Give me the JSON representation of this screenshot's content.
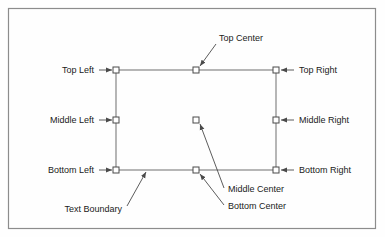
{
  "figure": {
    "background_color": "#fefefe",
    "frame_color": "#8c8c8c",
    "line_color": "#6e6e6e",
    "text_color": "#1a1a1a",
    "handle_fill": "#ffffff",
    "handle_stroke": "#4a4a4a"
  },
  "frame": {
    "x": 8,
    "y": 8,
    "width": 368,
    "height": 221
  },
  "text_boundary": {
    "label": "Text Boundary",
    "x": 116,
    "y": 70,
    "width": 160,
    "height": 100
  },
  "anchors": [
    {
      "name": "top-left",
      "label": "Top Left",
      "x": 116,
      "y": 70,
      "label_x": 94,
      "label_y": 73,
      "label_anchor": "end",
      "leader": "horizontal-right"
    },
    {
      "name": "top-center",
      "label": "Top Center",
      "x": 196,
      "y": 70,
      "label_x": 219,
      "label_y": 41,
      "label_anchor": "start",
      "leader": "diagonal-down-left"
    },
    {
      "name": "top-right",
      "label": "Top Right",
      "x": 276,
      "y": 70,
      "label_x": 299,
      "label_y": 73,
      "label_anchor": "start",
      "leader": "horizontal-left"
    },
    {
      "name": "middle-left",
      "label": "Middle Left",
      "x": 116,
      "y": 120,
      "label_x": 94,
      "label_y": 123,
      "label_anchor": "end",
      "leader": "horizontal-right"
    },
    {
      "name": "middle-center",
      "label": "Middle Center",
      "x": 196,
      "y": 120,
      "label_x": 228,
      "label_y": 192,
      "label_anchor": "start",
      "leader": "diagonal-up-left"
    },
    {
      "name": "middle-right",
      "label": "Middle Right",
      "x": 276,
      "y": 120,
      "label_x": 299,
      "label_y": 123,
      "label_anchor": "start",
      "leader": "horizontal-left"
    },
    {
      "name": "bottom-left",
      "label": "Bottom Left",
      "x": 116,
      "y": 170,
      "label_x": 94,
      "label_y": 173,
      "label_anchor": "end",
      "leader": "horizontal-right"
    },
    {
      "name": "bottom-center",
      "label": "Bottom Center",
      "x": 196,
      "y": 170,
      "label_x": 228,
      "label_y": 209,
      "label_anchor": "start",
      "leader": "diagonal-up-left"
    },
    {
      "name": "bottom-right",
      "label": "Bottom Right",
      "x": 276,
      "y": 170,
      "label_x": 299,
      "label_y": 173,
      "label_anchor": "start",
      "leader": "horizontal-left"
    }
  ],
  "boundary_callout": {
    "label": "Text Boundary",
    "label_x": 122,
    "label_y": 212,
    "label_anchor": "end",
    "from_x": 127,
    "from_y": 206,
    "to_x": 146,
    "to_y": 171
  },
  "handle": {
    "size": 6
  }
}
